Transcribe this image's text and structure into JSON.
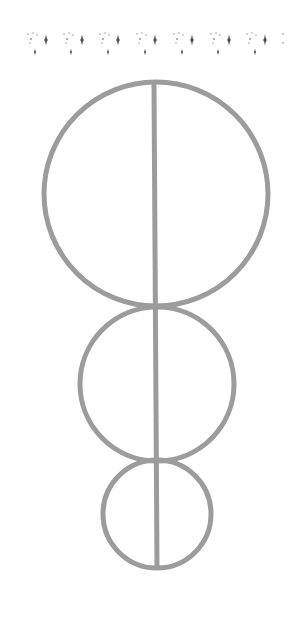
{
  "figure": {
    "background": "#ffffff",
    "stroke_color": "#9c9c9c",
    "stroke_width": 5,
    "sparkle_color": "#4a4a4a",
    "border": {
      "y_large": 40,
      "y_small": 52,
      "large_sparkle_x": [
        46,
        82,
        118,
        155,
        192,
        229,
        265
      ],
      "small_sparkle_x": [
        35,
        71,
        108,
        145,
        182,
        218,
        255
      ],
      "tail_dots_x": [
        283
      ]
    },
    "circles": [
      {
        "name": "large-circle",
        "cx": 156,
        "cy": 194,
        "r": 112
      },
      {
        "name": "medium-circle",
        "cx": 157,
        "cy": 384,
        "r": 77
      },
      {
        "name": "small-circle",
        "cx": 157,
        "cy": 514,
        "r": 54
      }
    ],
    "axis_line": {
      "x1": 154,
      "y1": 82,
      "x2": 157,
      "y2": 568
    }
  }
}
